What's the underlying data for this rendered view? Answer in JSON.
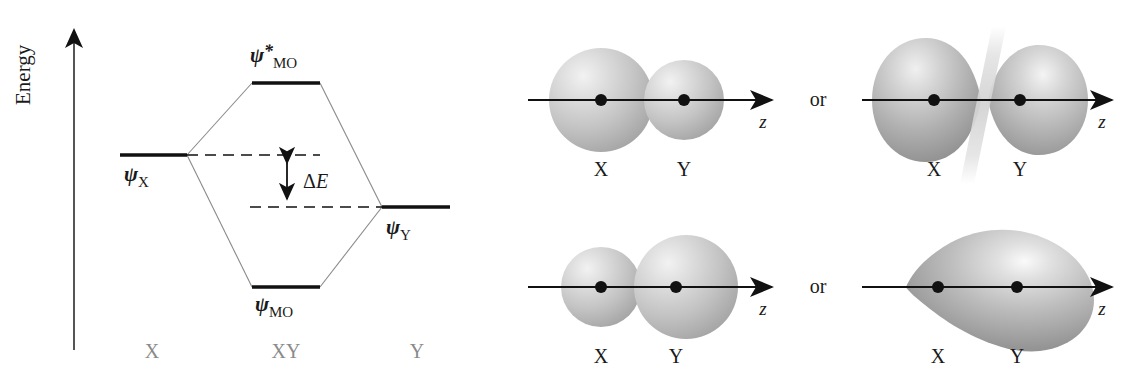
{
  "figure": {
    "energy_axis_label": "Energy"
  },
  "mo_diagram": {
    "levels": [
      {
        "key": "antibonding",
        "psi": "ψ",
        "star": "*",
        "subscript": "MO",
        "label_full": "ψ*MO"
      },
      {
        "key": "reactant_x",
        "psi": "ψ",
        "star": "",
        "subscript": "X",
        "label_full": "ψX"
      },
      {
        "key": "reactant_y",
        "psi": "ψ",
        "star": "",
        "subscript": "Y",
        "label_full": "ψY"
      },
      {
        "key": "bonding",
        "psi": "ψ",
        "star": "",
        "subscript": "MO",
        "label_full": "ψMO"
      }
    ],
    "delta_label_delta": "Δ",
    "delta_label_e": "E",
    "column_labels": [
      "X",
      "XY",
      "Y"
    ],
    "gray_color": "#8a8a8a"
  },
  "orbitals": {
    "or_label": "or",
    "axis_label": "z",
    "atom_labels": [
      "X",
      "Y"
    ],
    "panels": [
      {
        "key": "top-left",
        "caption_left": "X",
        "caption_right": "Y",
        "axis": "z"
      },
      {
        "key": "top-right",
        "caption_left": "X",
        "caption_right": "Y",
        "axis": "z"
      },
      {
        "key": "bottom-left",
        "caption_left": "X",
        "caption_right": "Y",
        "axis": "z"
      },
      {
        "key": "bottom-right",
        "caption_left": "X",
        "caption_right": "Y",
        "axis": "z"
      }
    ]
  }
}
